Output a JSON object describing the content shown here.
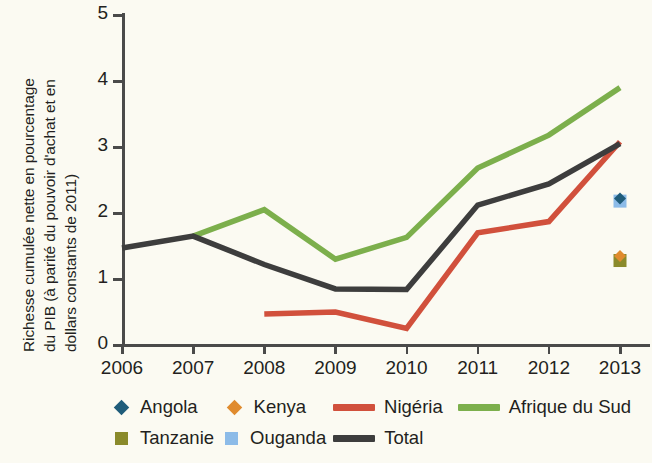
{
  "axes": {
    "ylabel_line1": "Richesse cumulée nette en pourcentage",
    "ylabel_line2": "du PIB (à parité du pouvoir d'achat et en",
    "ylabel_line3": "dollars constants de 2011)",
    "ytick_labels": [
      "0",
      "1",
      "2",
      "3",
      "4",
      "5"
    ],
    "xtick_labels": [
      "2006",
      "2007",
      "2008",
      "2009",
      "2010",
      "2011",
      "2012",
      "2013"
    ]
  },
  "legend": {
    "row1": [
      {
        "label": "Angola",
        "marker": "diamond",
        "color": "#1F5C7A",
        "name": "legend-item-angola"
      },
      {
        "label": "Kenya",
        "marker": "diamond",
        "color": "#E08B2E",
        "name": "legend-item-kenya"
      },
      {
        "label": "Nigéria",
        "marker": "line",
        "color": "#D1503C",
        "name": "legend-item-nigeria"
      },
      {
        "label": "Afrique du Sud",
        "marker": "line",
        "color": "#7CAF4C",
        "name": "legend-item-afrique-du-sud"
      }
    ],
    "row2": [
      {
        "label": "Tanzanie",
        "marker": "square",
        "color": "#8A8A2B",
        "name": "legend-item-tanzanie"
      },
      {
        "label": "Ouganda",
        "marker": "square",
        "color": "#8CBBE8",
        "name": "legend-item-ouganda"
      },
      {
        "label": "Total",
        "marker": "line",
        "color": "#3D3D3D",
        "name": "legend-item-total"
      }
    ]
  },
  "chart_data": {
    "type": "line",
    "title": "",
    "xlabel": "",
    "ylabel": "Richesse cumulée nette en pourcentage du PIB (à parité du pouvoir d'achat et en dollars constants de 2011)",
    "x": [
      2006,
      2007,
      2008,
      2009,
      2010,
      2011,
      2012,
      2013
    ],
    "xlim": [
      2006,
      2013
    ],
    "ylim": [
      0,
      5
    ],
    "yticks": [
      0,
      1,
      2,
      3,
      4,
      5
    ],
    "grid": false,
    "legend_position": "bottom",
    "series": [
      {
        "name": "Total",
        "color": "#3D3D3D",
        "style": "line",
        "x": [
          2006,
          2007,
          2008,
          2009,
          2010,
          2011,
          2012,
          2013
        ],
        "values": [
          1.47,
          1.65,
          1.22,
          0.85,
          0.84,
          2.12,
          2.44,
          3.05
        ]
      },
      {
        "name": "Afrique du Sud",
        "color": "#7CAF4C",
        "style": "line",
        "x": [
          2007,
          2008,
          2009,
          2010,
          2011,
          2012,
          2013
        ],
        "values": [
          1.65,
          2.05,
          1.3,
          1.63,
          2.68,
          3.18,
          3.9
        ]
      },
      {
        "name": "Nigéria",
        "color": "#D1503C",
        "style": "line",
        "x": [
          2008,
          2009,
          2010,
          2011,
          2012,
          2013
        ],
        "values": [
          0.47,
          0.5,
          0.25,
          1.7,
          1.87,
          3.08
        ]
      },
      {
        "name": "Angola",
        "color": "#1F5C7A",
        "style": "marker-diamond",
        "x": [
          2013
        ],
        "values": [
          2.22
        ]
      },
      {
        "name": "Kenya",
        "color": "#E08B2E",
        "style": "marker-diamond",
        "x": [
          2013
        ],
        "values": [
          1.35
        ]
      },
      {
        "name": "Tanzanie",
        "color": "#8A8A2B",
        "style": "marker-square",
        "x": [
          2013
        ],
        "values": [
          1.28
        ]
      },
      {
        "name": "Ouganda",
        "color": "#8CBBE8",
        "style": "marker-square",
        "x": [
          2013
        ],
        "values": [
          2.18
        ]
      }
    ]
  }
}
